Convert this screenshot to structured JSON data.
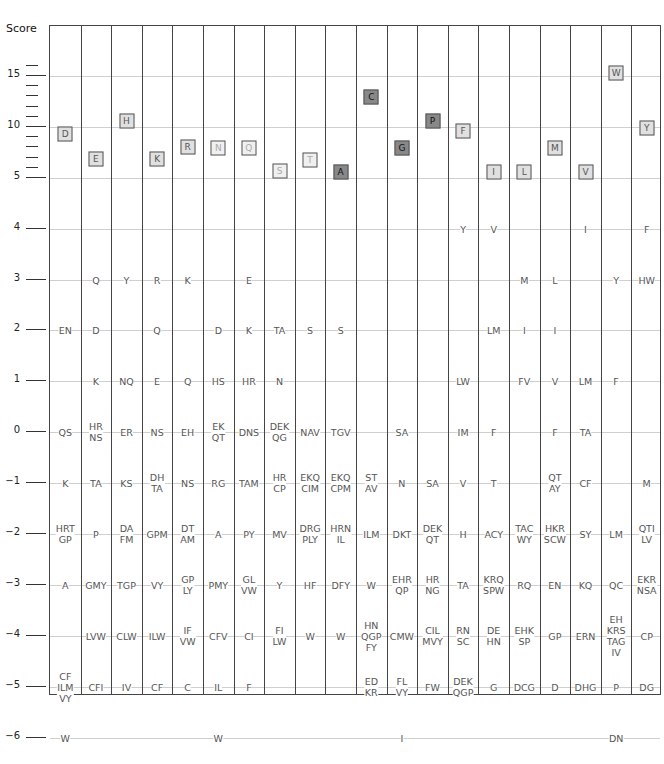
{
  "chart_data": {
    "type": "table",
    "title": "",
    "ylabel": "Score",
    "ylim": [
      -6.5,
      19
    ],
    "y_ticks_major": [
      15,
      10,
      5,
      4,
      3,
      2,
      1,
      0,
      -1,
      -2,
      -3,
      -4,
      -5,
      -6
    ],
    "y_ticks_minor_above_5": [
      16,
      14,
      13,
      12,
      11,
      9,
      8,
      7,
      6
    ],
    "columns": [
      "D",
      "E",
      "H",
      "K",
      "R",
      "N",
      "Q",
      "S",
      "T",
      "A",
      "C",
      "G",
      "P",
      "F",
      "I",
      "L",
      "M",
      "V",
      "W",
      "Y"
    ],
    "column_score_boxes": [
      {
        "label": "D",
        "score": 9.3,
        "shade": "light"
      },
      {
        "label": "E",
        "score": 6.9,
        "shade": "light"
      },
      {
        "label": "H",
        "score": 10.6,
        "shade": "light"
      },
      {
        "label": "K",
        "score": 6.9,
        "shade": "light"
      },
      {
        "label": "R",
        "score": 8.0,
        "shade": "light"
      },
      {
        "label": "N",
        "score": 7.9,
        "shade": "faint"
      },
      {
        "label": "Q",
        "score": 7.9,
        "shade": "faint"
      },
      {
        "label": "S",
        "score": 5.7,
        "shade": "faint"
      },
      {
        "label": "T",
        "score": 6.8,
        "shade": "faint"
      },
      {
        "label": "A",
        "score": 5.6,
        "shade": "dark"
      },
      {
        "label": "C",
        "score": 12.9,
        "shade": "dark"
      },
      {
        "label": "G",
        "score": 7.9,
        "shade": "dark"
      },
      {
        "label": "P",
        "score": 10.6,
        "shade": "dark"
      },
      {
        "label": "F",
        "score": 9.6,
        "shade": "light"
      },
      {
        "label": "I",
        "score": 5.6,
        "shade": "light"
      },
      {
        "label": "L",
        "score": 5.6,
        "shade": "light"
      },
      {
        "label": "M",
        "score": 7.9,
        "shade": "light"
      },
      {
        "label": "V",
        "score": 5.6,
        "shade": "light"
      },
      {
        "label": "W",
        "score": 15.3,
        "shade": "light"
      },
      {
        "label": "Y",
        "score": 9.9,
        "shade": "light"
      }
    ],
    "cells": [
      {
        "col": 0,
        "score": 2,
        "lines": [
          "EN"
        ]
      },
      {
        "col": 0,
        "score": 0,
        "lines": [
          "QS"
        ]
      },
      {
        "col": 0,
        "score": -1,
        "lines": [
          "K"
        ]
      },
      {
        "col": 0,
        "score": -2,
        "lines": [
          "HRT",
          "GP"
        ]
      },
      {
        "col": 0,
        "score": -3,
        "lines": [
          "A"
        ]
      },
      {
        "col": 0,
        "score": -5,
        "lines": [
          "CF",
          "ILM",
          "VY"
        ]
      },
      {
        "col": 0,
        "score": -6,
        "lines": [
          "W"
        ]
      },
      {
        "col": 1,
        "score": 3,
        "lines": [
          "Q"
        ]
      },
      {
        "col": 1,
        "score": 2,
        "lines": [
          "D"
        ]
      },
      {
        "col": 1,
        "score": 1,
        "lines": [
          "K"
        ]
      },
      {
        "col": 1,
        "score": 0,
        "lines": [
          "HR",
          "NS"
        ]
      },
      {
        "col": 1,
        "score": -1,
        "lines": [
          "TA"
        ]
      },
      {
        "col": 1,
        "score": -2,
        "lines": [
          "P"
        ]
      },
      {
        "col": 1,
        "score": -3,
        "lines": [
          "GMY"
        ]
      },
      {
        "col": 1,
        "score": -4,
        "lines": [
          "LVW"
        ]
      },
      {
        "col": 1,
        "score": -5,
        "lines": [
          "CFI"
        ]
      },
      {
        "col": 2,
        "score": 3,
        "lines": [
          "Y"
        ]
      },
      {
        "col": 2,
        "score": 1,
        "lines": [
          "NQ"
        ]
      },
      {
        "col": 2,
        "score": 0,
        "lines": [
          "ER"
        ]
      },
      {
        "col": 2,
        "score": -1,
        "lines": [
          "KS"
        ]
      },
      {
        "col": 2,
        "score": -2,
        "lines": [
          "DA",
          "FM"
        ]
      },
      {
        "col": 2,
        "score": -3,
        "lines": [
          "TGP"
        ]
      },
      {
        "col": 2,
        "score": -4,
        "lines": [
          "CLW"
        ]
      },
      {
        "col": 2,
        "score": -5,
        "lines": [
          "IV"
        ]
      },
      {
        "col": 3,
        "score": 3,
        "lines": [
          "R"
        ]
      },
      {
        "col": 3,
        "score": 2,
        "lines": [
          "Q"
        ]
      },
      {
        "col": 3,
        "score": 1,
        "lines": [
          "E"
        ]
      },
      {
        "col": 3,
        "score": 0,
        "lines": [
          "NS"
        ]
      },
      {
        "col": 3,
        "score": -1,
        "lines": [
          "DH",
          "TA"
        ]
      },
      {
        "col": 3,
        "score": -2,
        "lines": [
          "GPM"
        ]
      },
      {
        "col": 3,
        "score": -3,
        "lines": [
          "VY"
        ]
      },
      {
        "col": 3,
        "score": -4,
        "lines": [
          "ILW"
        ]
      },
      {
        "col": 3,
        "score": -5,
        "lines": [
          "CF"
        ]
      },
      {
        "col": 4,
        "score": 3,
        "lines": [
          "K"
        ]
      },
      {
        "col": 4,
        "score": 1,
        "lines": [
          "Q"
        ]
      },
      {
        "col": 4,
        "score": 0,
        "lines": [
          "EH"
        ]
      },
      {
        "col": 4,
        "score": -1,
        "lines": [
          "NS"
        ]
      },
      {
        "col": 4,
        "score": -2,
        "lines": [
          "DT",
          "AM"
        ]
      },
      {
        "col": 4,
        "score": -3,
        "lines": [
          "GP",
          "LY"
        ]
      },
      {
        "col": 4,
        "score": -4,
        "lines": [
          "IF",
          "VW"
        ]
      },
      {
        "col": 4,
        "score": -5,
        "lines": [
          "C"
        ]
      },
      {
        "col": 5,
        "score": 2,
        "lines": [
          "D"
        ]
      },
      {
        "col": 5,
        "score": 1,
        "lines": [
          "HS"
        ]
      },
      {
        "col": 5,
        "score": 0,
        "lines": [
          "EK",
          "QT"
        ]
      },
      {
        "col": 5,
        "score": -1,
        "lines": [
          "RG"
        ]
      },
      {
        "col": 5,
        "score": -2,
        "lines": [
          "A"
        ]
      },
      {
        "col": 5,
        "score": -3,
        "lines": [
          "PMY"
        ]
      },
      {
        "col": 5,
        "score": -4,
        "lines": [
          "CFV"
        ]
      },
      {
        "col": 5,
        "score": -5,
        "lines": [
          "IL"
        ]
      },
      {
        "col": 5,
        "score": -6,
        "lines": [
          "W"
        ]
      },
      {
        "col": 6,
        "score": 3,
        "lines": [
          "E"
        ]
      },
      {
        "col": 6,
        "score": 2,
        "lines": [
          "K"
        ]
      },
      {
        "col": 6,
        "score": 1,
        "lines": [
          "HR"
        ]
      },
      {
        "col": 6,
        "score": 0,
        "lines": [
          "DNS"
        ]
      },
      {
        "col": 6,
        "score": -1,
        "lines": [
          "TAM"
        ]
      },
      {
        "col": 6,
        "score": -2,
        "lines": [
          "PY"
        ]
      },
      {
        "col": 6,
        "score": -3,
        "lines": [
          "GL",
          "VW"
        ]
      },
      {
        "col": 6,
        "score": -4,
        "lines": [
          "CI"
        ]
      },
      {
        "col": 6,
        "score": -5,
        "lines": [
          "F"
        ]
      },
      {
        "col": 7,
        "score": 2,
        "lines": [
          "TA"
        ]
      },
      {
        "col": 7,
        "score": 1,
        "lines": [
          "N"
        ]
      },
      {
        "col": 7,
        "score": 0,
        "lines": [
          "DEK",
          "QG"
        ]
      },
      {
        "col": 7,
        "score": -1,
        "lines": [
          "HR",
          "CP"
        ]
      },
      {
        "col": 7,
        "score": -2,
        "lines": [
          "MV"
        ]
      },
      {
        "col": 7,
        "score": -3,
        "lines": [
          "Y"
        ]
      },
      {
        "col": 7,
        "score": -4,
        "lines": [
          "FI",
          "LW"
        ]
      },
      {
        "col": 8,
        "score": 2,
        "lines": [
          "S"
        ]
      },
      {
        "col": 8,
        "score": 0,
        "lines": [
          "NAV"
        ]
      },
      {
        "col": 8,
        "score": -1,
        "lines": [
          "EKQ",
          "CIM"
        ]
      },
      {
        "col": 8,
        "score": -2,
        "lines": [
          "DRG",
          "PLY"
        ]
      },
      {
        "col": 8,
        "score": -3,
        "lines": [
          "HF"
        ]
      },
      {
        "col": 8,
        "score": -4,
        "lines": [
          "W"
        ]
      },
      {
        "col": 9,
        "score": 2,
        "lines": [
          "S"
        ]
      },
      {
        "col": 9,
        "score": 0,
        "lines": [
          "TGV"
        ]
      },
      {
        "col": 9,
        "score": -1,
        "lines": [
          "EKQ",
          "CPM"
        ]
      },
      {
        "col": 9,
        "score": -2,
        "lines": [
          "HRN",
          "IL"
        ]
      },
      {
        "col": 9,
        "score": -3,
        "lines": [
          "DFY"
        ]
      },
      {
        "col": 9,
        "score": -4,
        "lines": [
          "W"
        ]
      },
      {
        "col": 10,
        "score": -1,
        "lines": [
          "ST",
          "AV"
        ]
      },
      {
        "col": 10,
        "score": -2,
        "lines": [
          "ILM"
        ]
      },
      {
        "col": 10,
        "score": -3,
        "lines": [
          "W"
        ]
      },
      {
        "col": 10,
        "score": -4,
        "lines": [
          "HN",
          "QGP",
          "FY"
        ]
      },
      {
        "col": 10,
        "score": -5,
        "lines": [
          "ED",
          "KR"
        ]
      },
      {
        "col": 11,
        "score": 0,
        "lines": [
          "SA"
        ]
      },
      {
        "col": 11,
        "score": -1,
        "lines": [
          "N"
        ]
      },
      {
        "col": 11,
        "score": -2,
        "lines": [
          "DKT"
        ]
      },
      {
        "col": 11,
        "score": -3,
        "lines": [
          "EHR",
          "QP"
        ]
      },
      {
        "col": 11,
        "score": -4,
        "lines": [
          "CMW"
        ]
      },
      {
        "col": 11,
        "score": -5,
        "lines": [
          "FL",
          "VY"
        ]
      },
      {
        "col": 11,
        "score": -6,
        "lines": [
          "I"
        ]
      },
      {
        "col": 12,
        "score": -1,
        "lines": [
          "SA"
        ]
      },
      {
        "col": 12,
        "score": -2,
        "lines": [
          "DEK",
          "QT"
        ]
      },
      {
        "col": 12,
        "score": -3,
        "lines": [
          "HR",
          "NG"
        ]
      },
      {
        "col": 12,
        "score": -4,
        "lines": [
          "CIL",
          "MVY"
        ]
      },
      {
        "col": 12,
        "score": -5,
        "lines": [
          "FW"
        ]
      },
      {
        "col": 13,
        "score": 4,
        "lines": [
          "Y"
        ]
      },
      {
        "col": 13,
        "score": 1,
        "lines": [
          "LW"
        ]
      },
      {
        "col": 13,
        "score": 0,
        "lines": [
          "IM"
        ]
      },
      {
        "col": 13,
        "score": -1,
        "lines": [
          "V"
        ]
      },
      {
        "col": 13,
        "score": -2,
        "lines": [
          "H"
        ]
      },
      {
        "col": 13,
        "score": -3,
        "lines": [
          "TA"
        ]
      },
      {
        "col": 13,
        "score": -4,
        "lines": [
          "RN",
          "SC"
        ]
      },
      {
        "col": 13,
        "score": -5,
        "lines": [
          "DEK",
          "QGP"
        ]
      },
      {
        "col": 14,
        "score": 4,
        "lines": [
          "V"
        ]
      },
      {
        "col": 14,
        "score": 2,
        "lines": [
          "LM"
        ]
      },
      {
        "col": 14,
        "score": 0,
        "lines": [
          "F"
        ]
      },
      {
        "col": 14,
        "score": -1,
        "lines": [
          "T"
        ]
      },
      {
        "col": 14,
        "score": -2,
        "lines": [
          "ACY"
        ]
      },
      {
        "col": 14,
        "score": -3,
        "lines": [
          "KRQ",
          "SPW"
        ]
      },
      {
        "col": 14,
        "score": -4,
        "lines": [
          "DE",
          "HN"
        ]
      },
      {
        "col": 14,
        "score": -5,
        "lines": [
          "G"
        ]
      },
      {
        "col": 15,
        "score": 3,
        "lines": [
          "M"
        ]
      },
      {
        "col": 15,
        "score": 2,
        "lines": [
          "I"
        ]
      },
      {
        "col": 15,
        "score": 1,
        "lines": [
          "FV"
        ]
      },
      {
        "col": 15,
        "score": -2,
        "lines": [
          "TAC",
          "WY"
        ]
      },
      {
        "col": 15,
        "score": -3,
        "lines": [
          "RQ"
        ]
      },
      {
        "col": 15,
        "score": -4,
        "lines": [
          "EHK",
          "SP"
        ]
      },
      {
        "col": 15,
        "score": -5,
        "lines": [
          "DCG"
        ]
      },
      {
        "col": 16,
        "score": 3,
        "lines": [
          "L"
        ]
      },
      {
        "col": 16,
        "score": 2,
        "lines": [
          "I"
        ]
      },
      {
        "col": 16,
        "score": 1,
        "lines": [
          "V"
        ]
      },
      {
        "col": 16,
        "score": 0,
        "lines": [
          "F"
        ]
      },
      {
        "col": 16,
        "score": -1,
        "lines": [
          "QT",
          "AY"
        ]
      },
      {
        "col": 16,
        "score": -2,
        "lines": [
          "HKR",
          "SCW"
        ]
      },
      {
        "col": 16,
        "score": -3,
        "lines": [
          "EN"
        ]
      },
      {
        "col": 16,
        "score": -4,
        "lines": [
          "GP"
        ]
      },
      {
        "col": 16,
        "score": -5,
        "lines": [
          "D"
        ]
      },
      {
        "col": 17,
        "score": 4,
        "lines": [
          "I"
        ]
      },
      {
        "col": 17,
        "score": 1,
        "lines": [
          "LM"
        ]
      },
      {
        "col": 17,
        "score": 0,
        "lines": [
          "TA"
        ]
      },
      {
        "col": 17,
        "score": -1,
        "lines": [
          "CF"
        ]
      },
      {
        "col": 17,
        "score": -2,
        "lines": [
          "SY"
        ]
      },
      {
        "col": 17,
        "score": -3,
        "lines": [
          "KQ"
        ]
      },
      {
        "col": 17,
        "score": -4,
        "lines": [
          "ERN"
        ]
      },
      {
        "col": 17,
        "score": -5,
        "lines": [
          "DHG"
        ]
      },
      {
        "col": 18,
        "score": 3,
        "lines": [
          "Y"
        ]
      },
      {
        "col": 18,
        "score": 1,
        "lines": [
          "F"
        ]
      },
      {
        "col": 18,
        "score": -2,
        "lines": [
          "LM"
        ]
      },
      {
        "col": 18,
        "score": -3,
        "lines": [
          "QC"
        ]
      },
      {
        "col": 18,
        "score": -4,
        "lines": [
          "EH",
          "KRS",
          "TAG",
          "IV"
        ]
      },
      {
        "col": 18,
        "score": -5,
        "lines": [
          "P"
        ]
      },
      {
        "col": 18,
        "score": -6,
        "lines": [
          "DN"
        ]
      },
      {
        "col": 19,
        "score": 4,
        "lines": [
          "F"
        ]
      },
      {
        "col": 19,
        "score": 3,
        "lines": [
          "HW"
        ]
      },
      {
        "col": 19,
        "score": -1,
        "lines": [
          "M"
        ]
      },
      {
        "col": 19,
        "score": -2,
        "lines": [
          "QTI",
          "LV"
        ]
      },
      {
        "col": 19,
        "score": -3,
        "lines": [
          "EKR",
          "NSA"
        ]
      },
      {
        "col": 19,
        "score": -4,
        "lines": [
          "CP"
        ]
      },
      {
        "col": 19,
        "score": -5,
        "lines": [
          "DG"
        ]
      }
    ],
    "grid": true,
    "legend": null
  }
}
